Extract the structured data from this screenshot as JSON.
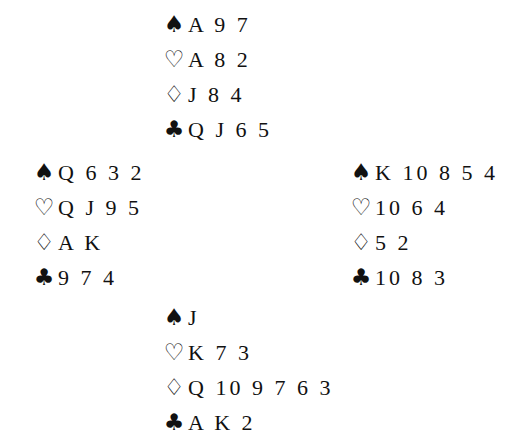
{
  "suit_symbols": {
    "spades": "♠",
    "hearts": "♡",
    "diamonds": "♢",
    "clubs": "♣"
  },
  "hands": {
    "north": {
      "spades": "A 9 7",
      "hearts": "A 8 2",
      "diamonds": "J 8 4",
      "clubs": "Q J 6 5"
    },
    "west": {
      "spades": "Q 6 3 2",
      "hearts": "Q J 9 5",
      "diamonds": "A K",
      "clubs": "9 7 4"
    },
    "east": {
      "spades": "K 10 8 5 4",
      "hearts": "10 6 4",
      "diamonds": "5 2",
      "clubs": "10 8 3"
    },
    "south": {
      "spades": "J",
      "hearts": "K 7 3",
      "diamonds": "Q 10 9 7 6 3",
      "clubs": "A K 2"
    }
  }
}
